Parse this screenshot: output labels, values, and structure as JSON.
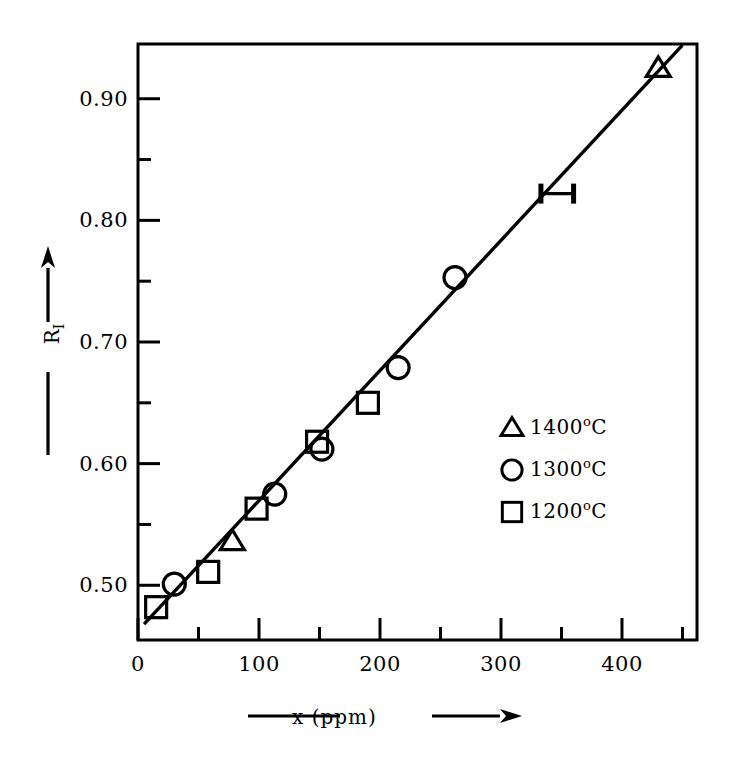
{
  "chart_data": {
    "type": "scatter",
    "title": "",
    "xlabel": "x (ppm)",
    "ylabel": "R_I",
    "xlim": [
      0,
      462
    ],
    "ylim": [
      0.455,
      0.945
    ],
    "grid": false,
    "legend_position": "right-middle",
    "x_ticks": [
      "0",
      "100",
      "200",
      "300",
      "400"
    ],
    "x_tick_values": [
      0,
      100,
      200,
      300,
      400
    ],
    "x_minor_tick_values": [
      50,
      150,
      250,
      350,
      450
    ],
    "y_ticks": [
      "0.50",
      "0.60",
      "0.70",
      "0.80",
      "0.90"
    ],
    "y_tick_values": [
      0.5,
      0.6,
      0.7,
      0.8,
      0.9
    ],
    "y_minor_tick_values": [
      0.55,
      0.65,
      0.75,
      0.85
    ],
    "series": [
      {
        "name": "1400°C",
        "marker": "triangle",
        "points": [
          {
            "x": 78,
            "y": 0.536
          },
          {
            "x": 430,
            "y": 0.925
          }
        ]
      },
      {
        "name": "1300°C",
        "marker": "circle",
        "points": [
          {
            "x": 30,
            "y": 0.501
          },
          {
            "x": 113,
            "y": 0.575
          },
          {
            "x": 152,
            "y": 0.612
          },
          {
            "x": 215,
            "y": 0.679
          },
          {
            "x": 262,
            "y": 0.753
          }
        ]
      },
      {
        "name": "1200°C",
        "marker": "square",
        "points": [
          {
            "x": 15,
            "y": 0.482
          },
          {
            "x": 58,
            "y": 0.511
          },
          {
            "x": 98,
            "y": 0.563
          },
          {
            "x": 148,
            "y": 0.618
          },
          {
            "x": 190,
            "y": 0.65
          }
        ]
      }
    ],
    "fit_line": {
      "x_start": 5,
      "y_start": 0.468,
      "x_end": 450,
      "y_end": 0.944
    },
    "error_bar": {
      "x_low": 333,
      "x_high": 360,
      "y": 0.822
    },
    "annotations": []
  },
  "axis_titles": {
    "x_title_text": "x (ppm)",
    "y_title_main": "R",
    "y_title_sub": "I"
  },
  "legend": {
    "entries": [
      {
        "marker_name": "triangle-marker",
        "label": "1400",
        "degree": "o",
        "unit": "C"
      },
      {
        "marker_name": "circle-marker",
        "label": "1300",
        "degree": "o",
        "unit": "C"
      },
      {
        "marker_name": "square-marker",
        "label": "1200",
        "degree": "o",
        "unit": "C"
      }
    ]
  },
  "colors": {
    "ink": "#000000",
    "background": "#ffffff"
  }
}
